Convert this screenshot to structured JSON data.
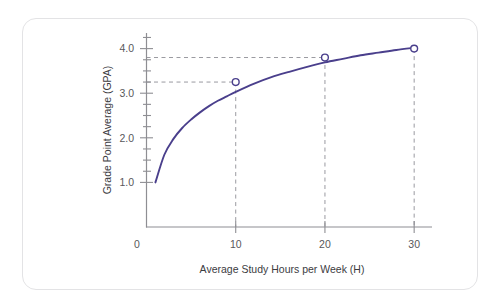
{
  "card": {
    "background_color": "#ffffff",
    "border_color": "#e3e3e5"
  },
  "chart_data": {
    "type": "line",
    "title": "",
    "subtitle": "",
    "xlabel": "Average Study Hours per Week (H)",
    "ylabel": "Grade Point Average (GPA)",
    "xlim": [
      0,
      32
    ],
    "ylim": [
      0,
      4.35
    ],
    "grid": false,
    "legend": null,
    "series": [
      {
        "name": "GPA vs Study Hours",
        "color": "#4a3f8c",
        "line_style": "solid",
        "marker": "open-circle",
        "x": [
          1,
          2,
          3,
          4,
          5,
          6,
          7,
          8,
          9,
          10,
          12,
          14,
          16,
          18,
          20,
          22,
          24,
          26,
          28,
          30
        ],
        "y": [
          1.0,
          1.62,
          1.97,
          2.22,
          2.41,
          2.57,
          2.71,
          2.83,
          2.93,
          3.03,
          3.21,
          3.36,
          3.48,
          3.59,
          3.69,
          3.77,
          3.85,
          3.91,
          3.97,
          4.02
        ]
      }
    ],
    "marked_points": [
      {
        "x": 10,
        "y": 3.25,
        "label": ""
      },
      {
        "x": 20,
        "y": 3.8,
        "label": ""
      },
      {
        "x": 30,
        "y": 4.0,
        "label": ""
      }
    ],
    "guide_lines": {
      "horizontal_values": [
        3.8,
        3.25
      ],
      "vertical_values": [
        10,
        20,
        30
      ],
      "color": "#9a9aa0",
      "style": "dashed"
    },
    "x_ticks": [
      {
        "value": 0,
        "label": "0"
      },
      {
        "value": 10,
        "label": "10"
      },
      {
        "value": 20,
        "label": "20"
      },
      {
        "value": 30,
        "label": "30"
      }
    ],
    "y_ticks": [
      {
        "value": 1.0,
        "label": "1.0"
      },
      {
        "value": 2.0,
        "label": "2.0"
      },
      {
        "value": 3.0,
        "label": "3.0"
      },
      {
        "value": 4.0,
        "label": "4.0"
      }
    ],
    "y_minor_ticks": [
      1.25,
      1.5,
      1.75,
      2.25,
      2.5,
      2.75,
      3.25,
      3.5,
      3.75,
      4.0,
      4.25
    ],
    "axis_color": "#8e8e93",
    "tick_label_color": "#58585b",
    "axis_title_color": "#3c3c3f"
  }
}
